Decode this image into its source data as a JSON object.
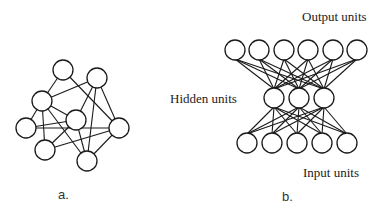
{
  "figure": {
    "panel_a": {
      "caption": "a.",
      "nodes": [
        {
          "id": "T",
          "x": 63,
          "y": 70,
          "r": 10
        },
        {
          "id": "TR",
          "x": 97,
          "y": 78,
          "r": 10
        },
        {
          "id": "ML",
          "x": 42,
          "y": 101,
          "r": 10
        },
        {
          "id": "C",
          "x": 76,
          "y": 120,
          "r": 10
        },
        {
          "id": "FL",
          "x": 26,
          "y": 128,
          "r": 10
        },
        {
          "id": "R",
          "x": 119,
          "y": 128,
          "r": 10
        },
        {
          "id": "BL",
          "x": 45,
          "y": 150,
          "r": 10
        },
        {
          "id": "BR",
          "x": 87,
          "y": 161,
          "r": 10
        }
      ],
      "edges": [
        [
          "T",
          "ML"
        ],
        [
          "T",
          "R"
        ],
        [
          "TR",
          "ML"
        ],
        [
          "TR",
          "C"
        ],
        [
          "TR",
          "R"
        ],
        [
          "TR",
          "BR"
        ],
        [
          "ML",
          "FL"
        ],
        [
          "ML",
          "C"
        ],
        [
          "ML",
          "BL"
        ],
        [
          "ML",
          "BR"
        ],
        [
          "FL",
          "C"
        ],
        [
          "FL",
          "R"
        ],
        [
          "C",
          "BL"
        ],
        [
          "C",
          "BR"
        ],
        [
          "BL",
          "R"
        ],
        [
          "R",
          "BR"
        ]
      ]
    },
    "panel_b": {
      "caption": "b.",
      "output_label": "Output units",
      "hidden_label": "Hidden units",
      "input_label": "Input units",
      "output_nodes": [
        {
          "x": 235,
          "y": 50
        },
        {
          "x": 259,
          "y": 50
        },
        {
          "x": 284,
          "y": 50
        },
        {
          "x": 308,
          "y": 50
        },
        {
          "x": 333,
          "y": 50
        },
        {
          "x": 357,
          "y": 50
        }
      ],
      "hidden_nodes": [
        {
          "x": 274,
          "y": 98
        },
        {
          "x": 299,
          "y": 98
        },
        {
          "x": 324,
          "y": 98
        }
      ],
      "input_nodes": [
        {
          "x": 247,
          "y": 143
        },
        {
          "x": 272,
          "y": 143
        },
        {
          "x": 297,
          "y": 143
        },
        {
          "x": 322,
          "y": 143
        },
        {
          "x": 347,
          "y": 143
        }
      ],
      "node_radius": 10,
      "connectivity": "fully connected between adjacent layers"
    }
  }
}
